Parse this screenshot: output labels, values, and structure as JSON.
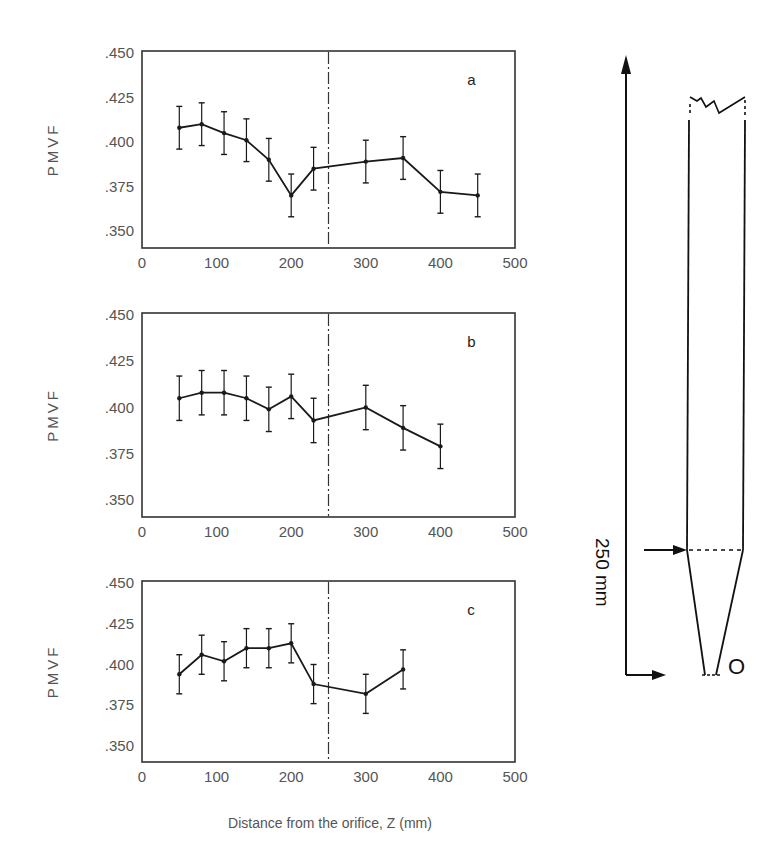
{
  "figure": {
    "xlabel": "Distance from the orifice, Z  (mm)",
    "ylabel": "PMVF",
    "x_ticks": [
      "0",
      "100",
      "200",
      "300",
      "400",
      "500"
    ],
    "y_ticks": [
      ".450",
      ".425",
      ".400",
      ".375",
      ".350"
    ],
    "divider_z": 250,
    "line_color": "#1a1a1a"
  },
  "chart_data": [
    {
      "type": "line",
      "panel": "a",
      "title": "",
      "xlabel": "",
      "ylabel": "PMVF",
      "xlim": [
        0,
        500
      ],
      "ylim": [
        0.341,
        0.45
      ],
      "x": [
        50,
        80,
        110,
        140,
        170,
        200,
        230,
        300,
        350,
        400,
        450
      ],
      "values": [
        0.408,
        0.41,
        0.405,
        0.401,
        0.39,
        0.37,
        0.385,
        0.389,
        0.391,
        0.372,
        0.37
      ],
      "error": 0.012,
      "annotations": [
        "vertical dash-dot line at Z = 250 mm"
      ]
    },
    {
      "type": "line",
      "panel": "b",
      "title": "",
      "xlabel": "",
      "ylabel": "PMVF",
      "xlim": [
        0,
        500
      ],
      "ylim": [
        0.341,
        0.45
      ],
      "x": [
        50,
        80,
        110,
        140,
        170,
        200,
        230,
        300,
        350,
        400
      ],
      "values": [
        0.405,
        0.408,
        0.408,
        0.405,
        0.399,
        0.406,
        0.393,
        0.4,
        0.389,
        0.379
      ],
      "error": 0.012,
      "annotations": [
        "vertical dash-dot line at Z = 250 mm"
      ]
    },
    {
      "type": "line",
      "panel": "c",
      "title": "",
      "xlabel": "Distance from the orifice, Z  (mm)",
      "ylabel": "PMVF",
      "xlim": [
        0,
        500
      ],
      "ylim": [
        0.341,
        0.45
      ],
      "x": [
        50,
        80,
        110,
        140,
        170,
        200,
        230,
        300,
        350
      ],
      "values": [
        0.394,
        0.406,
        0.402,
        0.41,
        0.41,
        0.413,
        0.388,
        0.382,
        0.397
      ],
      "error": 0.012,
      "annotations": [
        "vertical dash-dot line at Z = 250 mm"
      ]
    }
  ],
  "schematic": {
    "height_label": "250 mm",
    "orifice_label": "O"
  }
}
